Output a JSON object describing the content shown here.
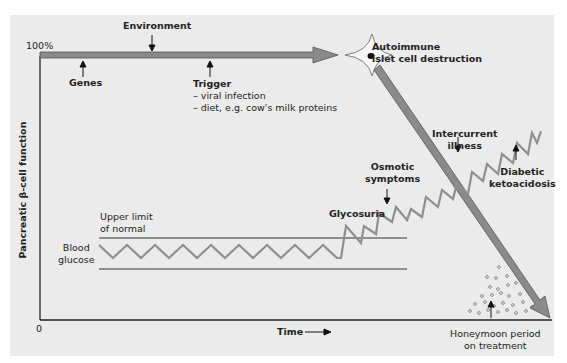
{
  "figure": {
    "y_axis": {
      "label": "Pancreatic β-cell function",
      "top_tick": "100%",
      "origin_tick": "0"
    },
    "x_axis": {
      "label": "Time"
    },
    "annotations": {
      "environment": "Environment",
      "genes": "Genes",
      "trigger": {
        "title": "Trigger",
        "items": [
          "– viral infection",
          "– diet, e.g. cow's milk proteins"
        ]
      },
      "autoimmune": [
        "Autoimmune",
        "islet cell destruction"
      ],
      "upper_limit": [
        "Upper limit",
        "of normal"
      ],
      "blood_glucose": [
        "Blood",
        "glucose"
      ],
      "glycosuria": "Glycosuria",
      "osmotic": [
        "Osmotic",
        "symptoms"
      ],
      "intercurrent": [
        "Intercurrent",
        "illness"
      ],
      "dka": [
        "Diabetic",
        "ketoacidosis"
      ],
      "honeymoon": [
        "Honeymoon period",
        "on treatment"
      ]
    },
    "colors": {
      "panel_bg": "#ebebeb",
      "arrow_fill": "#8a8a8a",
      "arrow_stroke": "#555555",
      "zigzag": "#8f8f8f",
      "axis": "#222222",
      "dots": "#777777"
    }
  }
}
